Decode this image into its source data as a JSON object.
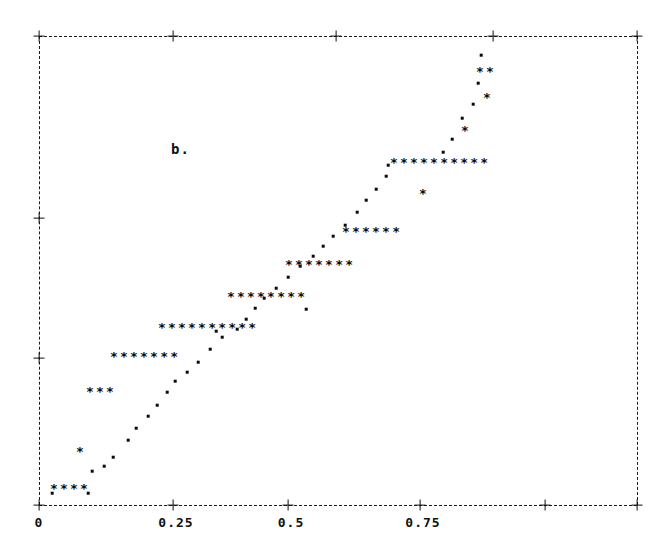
{
  "figure": {
    "panel_label": "b.",
    "marker_star": "*",
    "marker_dot": ".",
    "frame_color": "#101010",
    "background_color": "#ffffff"
  },
  "chart_data": {
    "type": "scatter",
    "title": "b.",
    "xlabel": "",
    "ylabel": "",
    "xlim": [
      0,
      0.895
    ],
    "ylim": [
      0,
      1
    ],
    "grid": false,
    "legend": null,
    "x_tick_labels": [
      "0",
      "0.25",
      "0.5",
      "0.75"
    ],
    "x_tick_values": [
      0,
      0.25,
      0.5,
      0.75
    ],
    "x_tick_px": [
      39,
      173,
      288,
      420
    ],
    "x_untitled_tick_px": [
      545,
      637
    ],
    "y_tick_px": [
      36,
      218,
      358,
      498
    ],
    "axis_style": "dashed-ascii",
    "tick_glyph": "+",
    "star_runs": [
      {
        "count": 4,
        "x_start_px": 50,
        "y_px": 488,
        "x_value": 0.02,
        "y_value": 0.02
      },
      {
        "count": 3,
        "x_start_px": 86,
        "y_px": 391,
        "x_value": 0.088,
        "y_value": 0.228
      },
      {
        "count": 7,
        "x_start_px": 110,
        "y_px": 356,
        "x_value": 0.133,
        "y_value": 0.303
      },
      {
        "count": 10,
        "x_start_px": 158,
        "y_px": 327,
        "x_value": 0.222,
        "y_value": 0.365
      },
      {
        "count": 8,
        "x_start_px": 227,
        "y_px": 296,
        "x_value": 0.351,
        "y_value": 0.432
      },
      {
        "count": 7,
        "x_start_px": 285,
        "y_px": 264,
        "x_value": 0.459,
        "y_value": 0.5
      },
      {
        "count": 6,
        "x_start_px": 342,
        "y_px": 231,
        "x_value": 0.565,
        "y_value": 0.571
      },
      {
        "count": 10,
        "x_start_px": 390,
        "y_px": 162,
        "x_value": 0.655,
        "y_value": 0.719
      },
      {
        "count": 2,
        "x_start_px": 476,
        "y_px": 71,
        "x_value": 0.816,
        "y_value": 0.915
      }
    ],
    "isolated_stars": [
      {
        "x_px": 81,
        "y_px": 451,
        "x_value": 0.078,
        "y_value": 0.101
      },
      {
        "x_px": 424,
        "y_px": 193,
        "x_value": 0.719,
        "y_value": 0.653
      },
      {
        "x_px": 466,
        "y_px": 130,
        "x_value": 0.797,
        "y_value": 0.788
      },
      {
        "x_px": 488,
        "y_px": 97,
        "x_value": 0.838,
        "y_value": 0.859
      }
    ],
    "dots": [
      {
        "x_px": 52,
        "y_px": 493,
        "x_value": 0.024,
        "y_value": 0.01
      },
      {
        "x_px": 88,
        "y_px": 493,
        "x_value": 0.091,
        "y_value": 0.01
      },
      {
        "x_px": 92,
        "y_px": 471,
        "x_value": 0.099,
        "y_value": 0.058
      },
      {
        "x_px": 104,
        "y_px": 466,
        "x_value": 0.121,
        "y_value": 0.069
      },
      {
        "x_px": 113,
        "y_px": 457,
        "x_value": 0.138,
        "y_value": 0.088
      },
      {
        "x_px": 128,
        "y_px": 440,
        "x_value": 0.166,
        "y_value": 0.124
      },
      {
        "x_px": 136,
        "y_px": 428,
        "x_value": 0.181,
        "y_value": 0.15
      },
      {
        "x_px": 148,
        "y_px": 416,
        "x_value": 0.203,
        "y_value": 0.176
      },
      {
        "x_px": 157,
        "y_px": 405,
        "x_value": 0.22,
        "y_value": 0.2
      },
      {
        "x_px": 167,
        "y_px": 392,
        "x_value": 0.239,
        "y_value": 0.228
      },
      {
        "x_px": 175,
        "y_px": 381,
        "x_value": 0.254,
        "y_value": 0.252
      },
      {
        "x_px": 187,
        "y_px": 372,
        "x_value": 0.276,
        "y_value": 0.271
      },
      {
        "x_px": 198,
        "y_px": 362,
        "x_value": 0.297,
        "y_value": 0.292
      },
      {
        "x_px": 210,
        "y_px": 349,
        "x_value": 0.319,
        "y_value": 0.321
      },
      {
        "x_px": 222,
        "y_px": 337,
        "x_value": 0.342,
        "y_value": 0.347
      },
      {
        "x_px": 237,
        "y_px": 329,
        "x_value": 0.37,
        "y_value": 0.364
      },
      {
        "x_px": 246,
        "y_px": 319,
        "x_value": 0.386,
        "y_value": 0.386
      },
      {
        "x_px": 255,
        "y_px": 308,
        "x_value": 0.403,
        "y_value": 0.409
      },
      {
        "x_px": 264,
        "y_px": 298,
        "x_value": 0.42,
        "y_value": 0.431
      },
      {
        "x_px": 276,
        "y_px": 288,
        "x_value": 0.443,
        "y_value": 0.452
      },
      {
        "x_px": 288,
        "y_px": 277,
        "x_value": 0.466,
        "y_value": 0.476
      },
      {
        "x_px": 300,
        "y_px": 266,
        "x_value": 0.488,
        "y_value": 0.5
      },
      {
        "x_px": 313,
        "y_px": 256,
        "x_value": 0.513,
        "y_value": 0.521
      },
      {
        "x_px": 323,
        "y_px": 246,
        "x_value": 0.532,
        "y_value": 0.543
      },
      {
        "x_px": 333,
        "y_px": 236,
        "x_value": 0.551,
        "y_value": 0.565
      },
      {
        "x_px": 345,
        "y_px": 225,
        "x_value": 0.573,
        "y_value": 0.588
      },
      {
        "x_px": 357,
        "y_px": 212,
        "x_value": 0.596,
        "y_value": 0.616
      },
      {
        "x_px": 366,
        "y_px": 200,
        "x_value": 0.613,
        "y_value": 0.642
      },
      {
        "x_px": 376,
        "y_px": 189,
        "x_value": 0.632,
        "y_value": 0.665
      },
      {
        "x_px": 386,
        "y_px": 176,
        "x_value": 0.651,
        "y_value": 0.693
      },
      {
        "x_px": 388,
        "y_px": 165,
        "x_value": 0.655,
        "y_value": 0.717
      },
      {
        "x_px": 443,
        "y_px": 152,
        "x_value": 0.758,
        "y_value": 0.745
      },
      {
        "x_px": 452,
        "y_px": 139,
        "x_value": 0.775,
        "y_value": 0.773
      },
      {
        "x_px": 462,
        "y_px": 118,
        "x_value": 0.794,
        "y_value": 0.818
      },
      {
        "x_px": 473,
        "y_px": 104,
        "x_value": 0.815,
        "y_value": 0.848
      },
      {
        "x_px": 478,
        "y_px": 83,
        "x_value": 0.824,
        "y_value": 0.893
      },
      {
        "x_px": 481,
        "y_px": 55,
        "x_value": 0.83,
        "y_value": 0.952
      },
      {
        "x_px": 306,
        "y_px": 309,
        "x_value": 0.499,
        "y_value": 0.407
      },
      {
        "x_px": 216,
        "y_px": 331,
        "x_value": 0.33,
        "y_value": 0.36
      }
    ]
  }
}
